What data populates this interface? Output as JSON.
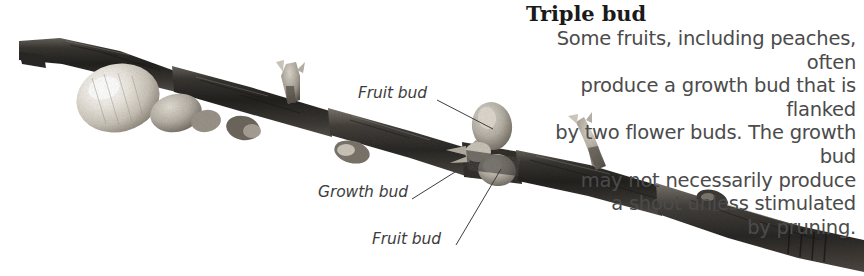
{
  "figure": {
    "width": 864,
    "height": 276,
    "background_color": "#ffffff"
  },
  "caption": {
    "title": "Triple bud",
    "body": "Some fruits, including peaches, often\nproduce a growth bud that is flanked\nby two flower buds. The growth bud\nmay not necessarily produce\na shoot unless stimulated\nby pruning.",
    "title_color": "#1a1a1a",
    "body_color": "#4b4b4b"
  },
  "annotations": [
    {
      "id": "fruit-bud-top",
      "label": "Fruit bud",
      "label_x": 358,
      "label_y": 84,
      "leader": {
        "x1": 437,
        "y1": 100,
        "x2": 493,
        "y2": 129
      }
    },
    {
      "id": "growth-bud",
      "label": "Growth bud",
      "label_x": 318,
      "label_y": 183,
      "leader": {
        "x1": 412,
        "y1": 199,
        "x2": 471,
        "y2": 162
      }
    },
    {
      "id": "fruit-bud-bottom",
      "label": "Fruit bud",
      "label_x": 372,
      "label_y": 230,
      "leader": {
        "x1": 456,
        "y1": 245,
        "x2": 501,
        "y2": 169
      }
    }
  ],
  "photo": {
    "description": "A grayscale photograph of a woody twig running diagonally from upper-left to lower-right across the frame.",
    "branch_color_dark": "#2e2c2a",
    "branch_color_mid": "#4a4744",
    "branch_color_light": "#8d8880",
    "bud_highlight_color": "#e8e4dc",
    "features": [
      {
        "name": "cut-end",
        "x": 20,
        "y": 47
      },
      {
        "name": "large-flower-bud",
        "x": 118,
        "y": 97
      },
      {
        "name": "secondary-bud",
        "x": 200,
        "y": 122
      },
      {
        "name": "upper-side-shoot",
        "x": 292,
        "y": 80
      },
      {
        "name": "lower-small-bud",
        "x": 352,
        "y": 155
      },
      {
        "name": "triple-bud-cluster",
        "x": 492,
        "y": 145
      },
      {
        "name": "right-side-shoot",
        "x": 586,
        "y": 136
      },
      {
        "name": "distal-node",
        "x": 760,
        "y": 228
      }
    ]
  }
}
